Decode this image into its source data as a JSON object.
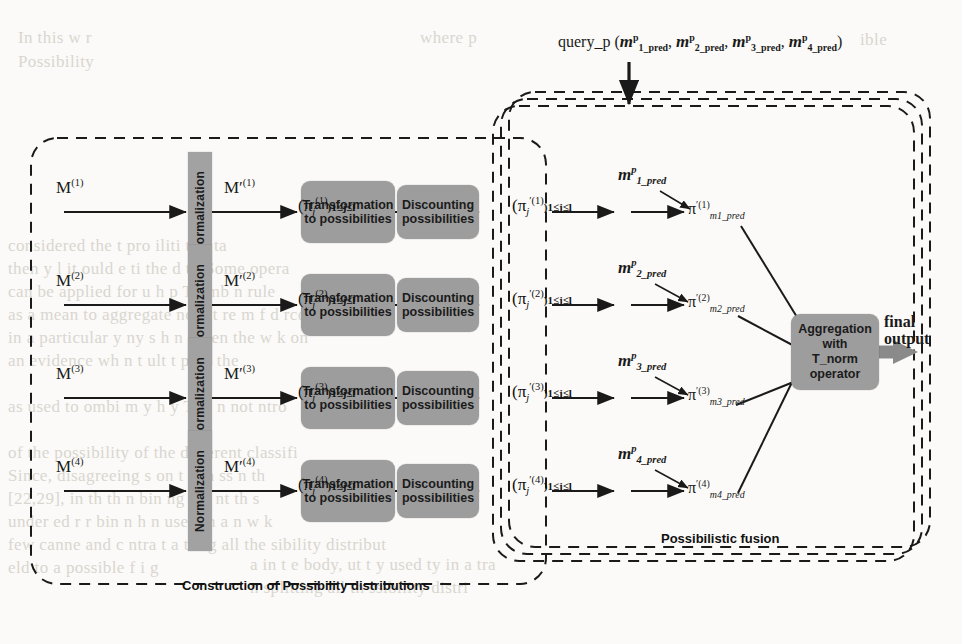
{
  "figure": {
    "title_query": "query_p (m",
    "background_note": "scanned page with faint show-through text"
  },
  "query": {
    "prefix": "query_p (",
    "items": [
      {
        "base": "m",
        "sup": "p",
        "sub": "1_pred"
      },
      {
        "base": "m",
        "sup": "p",
        "sub": "2_pred"
      },
      {
        "base": "m",
        "sup": "p",
        "sub": "3_pred"
      },
      {
        "base": "m",
        "sup": "p",
        "sub": "4_pred"
      }
    ],
    "separator": ", ",
    "suffix": ")"
  },
  "groups": {
    "left_caption": "Construction of Possibility distributions",
    "right_caption": "Possibilistic fusion"
  },
  "rows": [
    {
      "input_label": "M",
      "input_sup": "(1)",
      "normalization_label": "Normalization",
      "normalized_label": "M′",
      "normalized_sup": "(1)",
      "transform_label": "Transformation to possibilities",
      "pi_label": "(π",
      "pi_sub": "j",
      "pi_sup": "(1)",
      "pi_range": ")1≤j≤l",
      "discount_label": "Discounting possibilities",
      "pi_prime_sup": "′(1)",
      "pi_prime_range": ")1≤j≤l",
      "mass_pred": {
        "base": "m",
        "sup": "p",
        "sub": "1_pred"
      },
      "pi_pred": {
        "base": "π",
        "sup": "′(1)",
        "sub": "m1_pred"
      }
    },
    {
      "input_label": "M",
      "input_sup": "(2)",
      "normalization_label": "Normalization",
      "normalized_label": "M′",
      "normalized_sup": "(2)",
      "transform_label": "Transformation to possibilities",
      "pi_label": "(π",
      "pi_sub": "j",
      "pi_sup": "(2)",
      "pi_range": ")1≤j≤l",
      "discount_label": "Discounting possibilities",
      "pi_prime_sup": "′(2)",
      "pi_prime_range": ")1≤j≤l",
      "mass_pred": {
        "base": "m",
        "sup": "p",
        "sub": "2_pred"
      },
      "pi_pred": {
        "base": "π",
        "sup": "′(2)",
        "sub": "m2_pred"
      }
    },
    {
      "input_label": "M",
      "input_sup": "(3)",
      "normalization_label": "Normalization",
      "normalized_label": "M′",
      "normalized_sup": "(3)",
      "transform_label": "Transformation to possibilities",
      "pi_label": "(π",
      "pi_sub": "j",
      "pi_sup": "(3)",
      "pi_range": ")1≤j≤l",
      "discount_label": "Discounting possibilities",
      "pi_prime_sup": "′(3)",
      "pi_prime_range": ")1≤j≤l",
      "mass_pred": {
        "base": "m",
        "sup": "p",
        "sub": "3_pred"
      },
      "pi_pred": {
        "base": "π",
        "sup": "′(3)",
        "sub": "m3_pred"
      }
    },
    {
      "input_label": "M",
      "input_sup": "(4)",
      "normalization_label": "Normalization",
      "normalized_label": "M′",
      "normalized_sup": "(4)",
      "transform_label": "Transformation to possibilities",
      "pi_label": "(π",
      "pi_sub": "j",
      "pi_sup": "(4)",
      "pi_range": ")1≤j≤l",
      "discount_label": "Discounting possibilities",
      "pi_prime_sup": "′(4)",
      "pi_prime_range": ")1≤j≤l",
      "mass_pred": {
        "base": "m",
        "sup": "p",
        "sub": "4_pred"
      },
      "pi_pred": {
        "base": "π",
        "sup": "′(4)",
        "sub": "m4_pred"
      }
    }
  ],
  "aggregation": {
    "line1": "Aggregation",
    "line2": "with",
    "line3": "T_norm",
    "line4": "operator"
  },
  "output": {
    "line1": "final",
    "line2": "output"
  },
  "colors": {
    "box_fill": "#9d9d9d",
    "normalization_fill": "#a2a2a2",
    "stroke": "#1a1a1a",
    "arrow_thick": "#8a8a8a",
    "background": "#fbfaf8",
    "ghost_text": "#d9d6d0"
  },
  "ghost_text": [
    {
      "t": "In this w r",
      "x": 18,
      "y": 28
    },
    {
      "t": "Possibility",
      "x": 18,
      "y": 52
    },
    {
      "t": "where  p",
      "x": 420,
      "y": 28
    },
    {
      "t": "ible",
      "x": 860,
      "y": 30
    },
    {
      "t": "considered the  t   pro  iliti    t  th  ta",
      "x": 8,
      "y": 236
    },
    {
      "t": "then y  l  it  ould    e   ti   the     d    t  . Some opera",
      "x": 8,
      "y": 259
    },
    {
      "t": "can be applied  for  u h  p     Th   mb   n   rule",
      "x": 8,
      "y": 282
    },
    {
      "t": "as a mean to aggregate    nd  int   re    m   f     d   rce",
      "x": 8,
      "y": 305
    },
    {
      "t": "in a particular     y     ny s  h   n  ll    ven the w  k on",
      "x": 8,
      "y": 328
    },
    {
      "t": "an evidence      wh n  t     ult     t   p   on     the",
      "x": 8,
      "y": 351
    },
    {
      "t": "as used to  ombi      m   y   h  y   T       m  n   not  ntro",
      "x": 8,
      "y": 397
    },
    {
      "t": "of  the  possibility   of    the  different  classifi",
      "x": 8,
      "y": 443
    },
    {
      "t": "Since, disagreeing   s    on   t   w   n     ss     n  th",
      "x": 8,
      "y": 466
    },
    {
      "t": "[22,29], in  th       th  n    bin  ng  me   nt      th   s",
      "x": 8,
      "y": 489
    },
    {
      "t": "under     ed    r      r  bin   n   h     n    used in a  n w  k",
      "x": 8,
      "y": 512
    },
    {
      "t": "few  canne  and  c  ntra t   a  tting  all  the    sibility  distribut",
      "x": 8,
      "y": 535
    },
    {
      "t": "eld  to  a  possible  f  i  g",
      "x": 8,
      "y": 558
    },
    {
      "t": "a in t e body,  ut t   y  used   ty in a tra",
      "x": 250,
      "y": 555
    },
    {
      "t": "n  splitting  all   th    ssibility  distri",
      "x": 250,
      "y": 578
    }
  ]
}
